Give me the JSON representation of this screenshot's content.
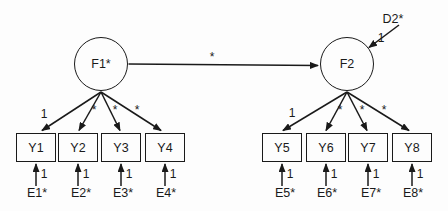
{
  "canvas": {
    "background": "#fdfdfd",
    "stroke_color": "#1a1a1a"
  },
  "factors": {
    "f1": {
      "label": "F1*"
    },
    "f2": {
      "label": "F2"
    }
  },
  "structural_path": {
    "label": "*"
  },
  "disturbance": {
    "label": "D2*",
    "loading": "1"
  },
  "left_measurement": {
    "loadings": [
      "1",
      "*",
      "*",
      "*"
    ],
    "indicators": [
      "Y1",
      "Y2",
      "Y3",
      "Y4"
    ],
    "error_loadings": [
      "1",
      "1",
      "1",
      "1"
    ],
    "errors": [
      "E1*",
      "E2*",
      "E3*",
      "E4*"
    ]
  },
  "right_measurement": {
    "loadings": [
      "1",
      "*",
      "*",
      "*"
    ],
    "indicators": [
      "Y5",
      "Y6",
      "Y7",
      "Y8"
    ],
    "error_loadings": [
      "1",
      "1",
      "1",
      "1"
    ],
    "errors": [
      "E5*",
      "E6*",
      "E7*",
      "E8*"
    ]
  }
}
